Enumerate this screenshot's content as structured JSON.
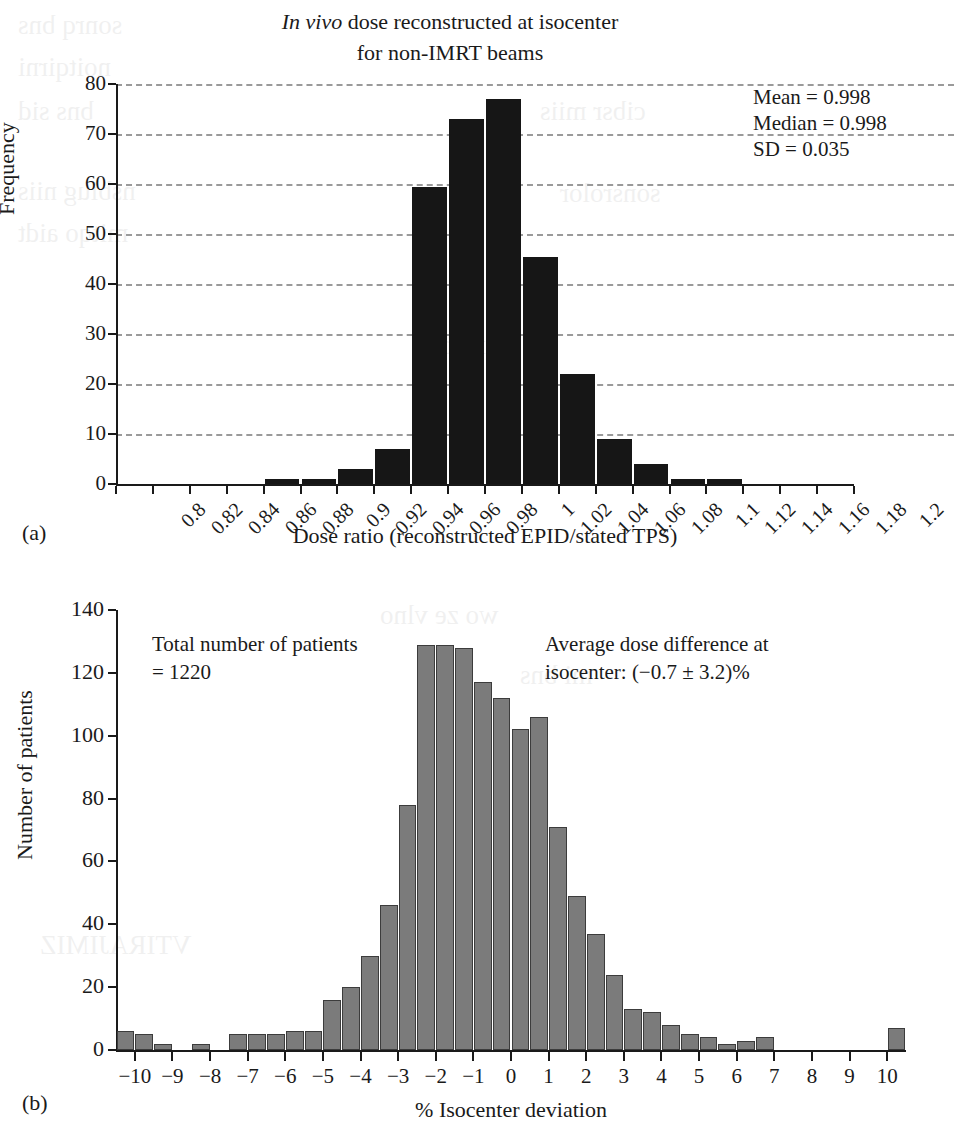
{
  "panel_a": {
    "label": "(a)",
    "title_line1_italic": "In vivo",
    "title_line1_rest": " dose reconstructed at isocenter",
    "title_line2": "for non-IMRT beams",
    "stats": [
      "Mean = 0.998",
      "Median = 0.998",
      "SD = 0.035"
    ]
  },
  "panel_b": {
    "label": "(b)",
    "note_left_line1": "Total number of patients",
    "note_left_line2": "= 1220",
    "note_right_line1": "Average dose difference at",
    "note_right_line2": "isocenter: (−0.7 ± 3.2)%"
  },
  "chart_data": [
    {
      "type": "bar",
      "title": "In vivo dose reconstructed at isocenter for non-IMRT beams",
      "xlabel": "Dose ratio (reconstructed EPID/stated TPS)",
      "ylabel": "Frequency",
      "ylim": [
        0,
        80
      ],
      "yticks": [
        0,
        10,
        20,
        30,
        40,
        50,
        60,
        70,
        80
      ],
      "xticks": [
        "0.8",
        "0.82",
        "0.84",
        "0.86",
        "0.88",
        "0.9",
        "0.92",
        "0.94",
        "0.96",
        "0.98",
        "1",
        "1.02",
        "1.04",
        "1.06",
        "1.08",
        "1.1",
        "1.12",
        "1.14",
        "1.16",
        "1.18",
        "1.2"
      ],
      "grid": true,
      "legend": "none",
      "bar_color": "#161616",
      "categories": [
        0.8,
        0.82,
        0.84,
        0.86,
        0.88,
        0.9,
        0.92,
        0.94,
        0.96,
        0.98,
        1.0,
        1.02,
        1.04,
        1.06,
        1.08,
        1.1,
        1.12,
        1.14,
        1.16,
        1.18,
        1.2
      ],
      "values": [
        0,
        0,
        0,
        0,
        1,
        1,
        3,
        7,
        59.5,
        73,
        77,
        45.5,
        22,
        9,
        4,
        1,
        1,
        0,
        0,
        0,
        0
      ],
      "annotations": [
        "Mean = 0.998",
        "Median = 0.998",
        "SD = 0.035"
      ]
    },
    {
      "type": "bar",
      "title": "",
      "xlabel": "% Isocenter deviation",
      "ylabel": "Number of patients",
      "ylim": [
        0,
        140
      ],
      "yticks": [
        0,
        20,
        40,
        60,
        80,
        100,
        120,
        140
      ],
      "xticks": [
        "−10",
        "−9",
        "−8",
        "−7",
        "−6",
        "−5",
        "−4",
        "−3",
        "−2",
        "−1",
        "0",
        "1",
        "2",
        "3",
        "4",
        "5",
        "6",
        "7",
        "8",
        "9",
        "10"
      ],
      "grid": false,
      "legend": "none",
      "bar_color": "#7b7b7b",
      "x": [
        -10.25,
        -9.75,
        -9.25,
        -8.75,
        -8.25,
        -7.75,
        -7.25,
        -6.75,
        -6.25,
        -5.75,
        -5.25,
        -4.75,
        -4.25,
        -3.75,
        -3.25,
        -2.75,
        -2.25,
        -1.75,
        -1.25,
        -0.75,
        -0.25,
        0.25,
        0.75,
        1.25,
        1.75,
        2.25,
        2.75,
        3.25,
        3.75,
        4.25,
        4.75,
        5.25,
        5.75,
        6.25,
        6.75,
        7.25,
        7.75,
        8.25,
        8.75,
        9.25,
        9.75,
        10.25
      ],
      "values": [
        6,
        5,
        2,
        0,
        2,
        0,
        5,
        5,
        5,
        6,
        6,
        16,
        20,
        30,
        46,
        78,
        129,
        129,
        128,
        117,
        112,
        102,
        106,
        71,
        49,
        37,
        24,
        13,
        12,
        8,
        5,
        4,
        2,
        3,
        4,
        0,
        0,
        0,
        0,
        0,
        0,
        7
      ],
      "annotations": [
        "Total number of patients = 1220",
        "Average dose difference at isocenter: (−0.7 ± 3.2)%"
      ]
    }
  ]
}
